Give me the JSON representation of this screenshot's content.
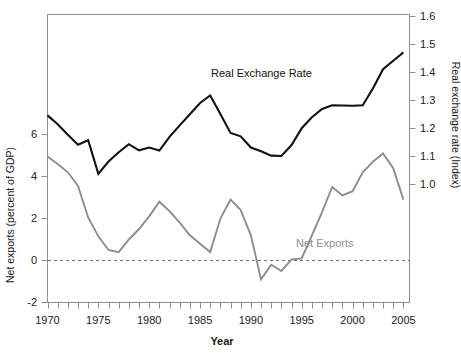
{
  "chart_data": {
    "type": "line",
    "title": "",
    "xlabel": "Year",
    "ylabel": "Net exports (percent of GDP)",
    "y2label": "Real exchange rate (Index)",
    "grid": false,
    "legend_position": "inline-annotations",
    "xlim": [
      1970,
      2005.6
    ],
    "ylim": [
      -2,
      7.9
    ],
    "y2lim": [
      0.93,
      1.63
    ],
    "xticks_labeled": [
      "1970",
      "1975",
      "1980",
      "1985",
      "1990",
      "1995",
      "2000",
      "2005"
    ],
    "xticks_labeled_values": [
      1970,
      1975,
      1980,
      1985,
      1990,
      1995,
      2000,
      2005
    ],
    "xticks_minor_interval": 1,
    "yticks_left": [
      "-2",
      "0",
      "2",
      "4",
      "6"
    ],
    "yticks_left_values": [
      -2,
      0,
      2,
      4,
      6
    ],
    "yticks_right": [
      "1.0",
      "1.1",
      "1.2",
      "1.3",
      "1.4",
      "1.5",
      "1.6"
    ],
    "yticks_right_values": [
      1.0,
      1.1,
      1.2,
      1.3,
      1.4,
      1.5,
      1.6
    ],
    "zero_reference_line": 0,
    "x": [
      1970,
      1971,
      1972,
      1973,
      1974,
      1975,
      1976,
      1977,
      1978,
      1979,
      1980,
      1981,
      1982,
      1983,
      1984,
      1985,
      1986,
      1987,
      1988,
      1989,
      1990,
      1991,
      1992,
      1993,
      1994,
      1995,
      1996,
      1997,
      1998,
      1999,
      2000,
      2001,
      2002,
      2003,
      2004,
      2005
    ],
    "series": [
      {
        "name": "Real Exchange Rate",
        "axis": "right",
        "color": "#111111",
        "label_text": "Real Exchange Rate",
        "values": [
          1.25,
          1.22,
          1.18,
          1.14,
          1.16,
          1.04,
          1.08,
          1.11,
          1.14,
          1.12,
          1.13,
          1.12,
          1.17,
          1.21,
          1.25,
          1.29,
          1.32,
          1.25,
          1.18,
          1.17,
          1.13,
          1.12,
          1.1,
          1.1,
          1.14,
          1.2,
          1.24,
          1.27,
          1.28,
          1.28,
          1.28,
          1.28,
          1.34,
          1.41,
          1.44,
          1.47
        ]
      },
      {
        "name": "Net Exports",
        "axis": "left",
        "color": "#8d8d8d",
        "label_text": "Net Exports",
        "values": [
          4.9,
          4.6,
          4.2,
          3.6,
          2.1,
          1.2,
          0.5,
          0.4,
          1.0,
          1.5,
          2.1,
          2.8,
          2.4,
          1.8,
          1.2,
          0.8,
          0.4,
          2.0,
          2.9,
          2.4,
          1.2,
          -0.9,
          -0.2,
          -0.5,
          0.05,
          0.1,
          1.2,
          2.3,
          3.5,
          3.1,
          3.3,
          4.2,
          4.7,
          5.1,
          4.4,
          2.9
        ]
      }
    ],
    "raw_series_rendered": {
      "note": "values below are the actual polyline vertices read off the plot",
      "real_exchange_rate_right_axis": [
        [
          1970,
          1.247
        ],
        [
          1971,
          1.215
        ],
        [
          1972,
          1.178
        ],
        [
          1973,
          1.142
        ],
        [
          1974,
          1.158
        ],
        [
          1975,
          1.038
        ],
        [
          1976,
          1.082
        ],
        [
          1977,
          1.115
        ],
        [
          1978,
          1.144
        ],
        [
          1979,
          1.122
        ],
        [
          1980,
          1.132
        ],
        [
          1981,
          1.121
        ],
        [
          1982,
          1.17
        ],
        [
          1983,
          1.211
        ],
        [
          1984,
          1.251
        ],
        [
          1985,
          1.291
        ],
        [
          1986,
          1.318
        ],
        [
          1987,
          1.252
        ],
        [
          1988,
          1.184
        ],
        [
          1989,
          1.172
        ],
        [
          1990,
          1.132
        ],
        [
          1991,
          1.119
        ],
        [
          1992,
          1.103
        ],
        [
          1993,
          1.102
        ],
        [
          1994,
          1.141
        ],
        [
          1995,
          1.201
        ],
        [
          1996,
          1.24
        ],
        [
          1997,
          1.27
        ],
        [
          1998,
          1.283
        ],
        [
          1999,
          1.282
        ],
        [
          2000,
          1.281
        ],
        [
          2001,
          1.283
        ],
        [
          2002,
          1.343
        ],
        [
          2003,
          1.412
        ],
        [
          2004,
          1.442
        ],
        [
          2005,
          1.472
        ]
      ],
      "net_exports_left_axis": [
        [
          1970,
          4.95
        ],
        [
          1971,
          4.6
        ],
        [
          1972,
          4.2
        ],
        [
          1973,
          3.55
        ],
        [
          1974,
          2.05
        ],
        [
          1975,
          1.15
        ],
        [
          1976,
          0.5
        ],
        [
          1977,
          0.4
        ],
        [
          1978,
          1.0
        ],
        [
          1979,
          1.5
        ],
        [
          1980,
          2.1
        ],
        [
          1981,
          2.8
        ],
        [
          1982,
          2.35
        ],
        [
          1983,
          1.8
        ],
        [
          1984,
          1.2
        ],
        [
          1985,
          0.8
        ],
        [
          1986,
          0.4
        ],
        [
          1987,
          2.0
        ],
        [
          1988,
          2.9
        ],
        [
          1989,
          2.4
        ],
        [
          1990,
          1.2
        ],
        [
          1991,
          -0.9
        ],
        [
          1992,
          -0.2
        ],
        [
          1993,
          -0.5
        ],
        [
          1994,
          0.05
        ],
        [
          1995,
          0.1
        ],
        [
          1996,
          1.2
        ],
        [
          1997,
          2.3
        ],
        [
          1998,
          3.5
        ],
        [
          1999,
          3.1
        ],
        [
          2000,
          3.3
        ],
        [
          2001,
          4.2
        ],
        [
          2002,
          4.7
        ],
        [
          2003,
          5.1
        ],
        [
          2004,
          4.4
        ],
        [
          2005,
          2.9
        ]
      ]
    }
  },
  "annotations": {
    "rer_label": "Real Exchange Rate",
    "nx_label": "Net Exports"
  },
  "colors": {
    "real_exchange_rate": "#111111",
    "net_exports": "#8d8d8d",
    "axis": "#8e8e8e",
    "background": "#ffffff"
  }
}
